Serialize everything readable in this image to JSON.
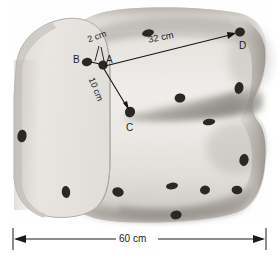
{
  "points": {
    "A": {
      "label": "A",
      "x": 103,
      "y": 64
    },
    "B": {
      "label": "B",
      "x": 87,
      "y": 62
    },
    "C": {
      "label": "C",
      "x": 130,
      "y": 112
    },
    "D": {
      "label": "D",
      "x": 240,
      "y": 32
    }
  },
  "measurements": {
    "ab": {
      "label": "2 cm",
      "value": 2,
      "unit": "cm",
      "from": "A",
      "to": "B"
    },
    "ac": {
      "label": "10 cm",
      "value": 10,
      "unit": "cm",
      "from": "A",
      "to": "C"
    },
    "ad": {
      "label": "32 cm",
      "value": 32,
      "unit": "cm",
      "from": "A",
      "to": "D"
    },
    "length": {
      "label": "60 cm",
      "value": 60,
      "unit": "cm",
      "of": "loaf-length"
    }
  },
  "colors": {
    "bread_light": "#e9e7e3",
    "bread_mid": "#d2cec8",
    "bread_shadow": "#9c9792",
    "bread_dark": "#7e7a76",
    "cut_face": "#e3e1dd",
    "raisin": "#2a2724",
    "ink": "#1c1c1c",
    "background": "#ffffff"
  },
  "raisins": [
    {
      "name": "raisin-b",
      "cx": 87,
      "cy": 62,
      "rx": 5.2,
      "ry": 4.2,
      "rot": -15,
      "labelled": "B"
    },
    {
      "name": "raisin-a",
      "cx": 103,
      "cy": 65,
      "rx": 4.6,
      "ry": 4.6,
      "rot": 10,
      "labelled": "A"
    },
    {
      "name": "raisin-c",
      "cx": 130,
      "cy": 112,
      "rx": 5.0,
      "ry": 5.4,
      "rot": 20,
      "labelled": "C"
    },
    {
      "name": "raisin-d",
      "cx": 240,
      "cy": 32,
      "rx": 5.0,
      "ry": 4.6,
      "rot": -10,
      "labelled": "D"
    },
    {
      "name": "raisin-top-1",
      "cx": 148,
      "cy": 33,
      "rx": 6.0,
      "ry": 3.6,
      "rot": -12
    },
    {
      "name": "raisin-right-1",
      "cx": 239,
      "cy": 88,
      "rx": 4.4,
      "ry": 6.0,
      "rot": 12
    },
    {
      "name": "raisin-mid-1",
      "cx": 180,
      "cy": 98,
      "rx": 5.4,
      "ry": 4.6,
      "rot": -8
    },
    {
      "name": "raisin-mid-2",
      "cx": 209,
      "cy": 122,
      "rx": 6.2,
      "ry": 3.2,
      "rot": -6
    },
    {
      "name": "raisin-left-1",
      "cx": 22,
      "cy": 136,
      "rx": 4.6,
      "ry": 6.4,
      "rot": 8
    },
    {
      "name": "raisin-left-2",
      "cx": 66,
      "cy": 192,
      "rx": 4.2,
      "ry": 6.0,
      "rot": -6
    },
    {
      "name": "raisin-low-1",
      "cx": 118,
      "cy": 190,
      "rx": 5.8,
      "ry": 4.2,
      "rot": 16
    },
    {
      "name": "raisin-low-2",
      "cx": 172,
      "cy": 186,
      "rx": 6.0,
      "ry": 3.4,
      "rot": -10
    },
    {
      "name": "raisin-low-3",
      "cx": 244,
      "cy": 160,
      "rx": 4.6,
      "ry": 6.0,
      "rot": 10
    },
    {
      "name": "raisin-low-4",
      "cx": 171,
      "cy": 176,
      "rx": 5.0,
      "ry": 4.0,
      "rot": 14
    },
    {
      "name": "raisin-low-5",
      "cx": 205,
      "cy": 190,
      "rx": 5.0,
      "ry": 4.4,
      "rot": -14
    },
    {
      "name": "raisin-low-6",
      "cx": 237,
      "cy": 190,
      "rx": 5.4,
      "ry": 4.2,
      "rot": 8
    },
    {
      "name": "raisin-low-7",
      "cx": 176,
      "cy": 215,
      "rx": 5.6,
      "ry": 4.4,
      "rot": -8
    },
    {
      "name": "raisin-low-8",
      "cx": 120,
      "cy": 196,
      "rx": 5.6,
      "ry": 4.8,
      "rot": 22
    }
  ]
}
